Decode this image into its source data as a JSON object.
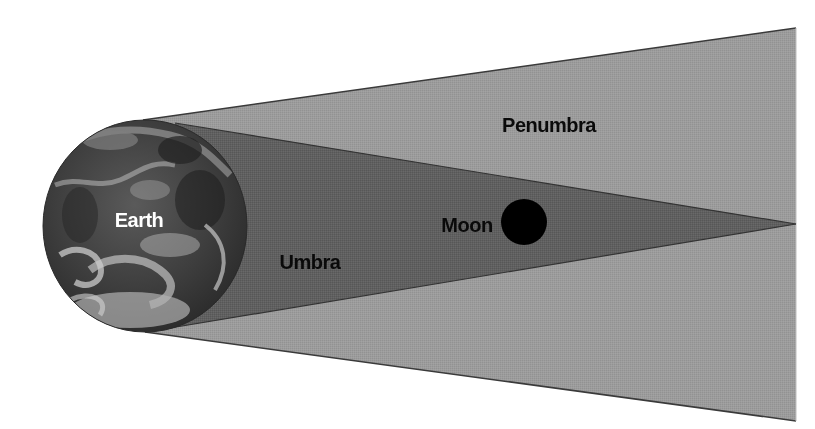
{
  "diagram": {
    "colors": {
      "background": "#ffffff",
      "penumbra": "#9a9a9a",
      "umbra": "#5f5f5f",
      "edge": "#3a3a3a",
      "moon": "#000000",
      "label_dark": "#0a0a0a",
      "label_light": "#ffffff"
    },
    "labels": {
      "earth": "Earth",
      "moon": "Moon",
      "umbra": "Umbra",
      "penumbra": "Penumbra"
    },
    "geometry": {
      "earth": {
        "cx": 145,
        "cy": 226,
        "rx": 102,
        "ry": 106
      },
      "moon": {
        "cx": 524,
        "cy": 222,
        "r": 23
      },
      "penumbra": {
        "top_start": [
          143,
          120
        ],
        "top_end": [
          796,
          28
        ],
        "bottom_start": [
          145,
          332
        ],
        "bottom_end": [
          796,
          421
        ]
      },
      "umbra": {
        "top_start": [
          175,
          123
        ],
        "bottom_start": [
          170,
          328
        ],
        "apex": [
          796,
          224
        ]
      }
    }
  }
}
